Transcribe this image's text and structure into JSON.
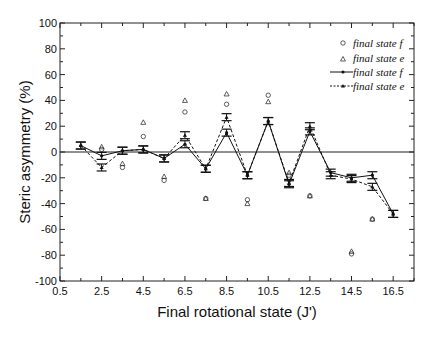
{
  "chart_data": {
    "type": "line",
    "title": "",
    "xlabel": "Final rotational state (J')",
    "ylabel": "Steric asymmetry (%)",
    "xlim": [
      0.5,
      17.5
    ],
    "ylim": [
      -100,
      100
    ],
    "x_ticks": [
      "0.5",
      "2.5",
      "4.5",
      "6.5",
      "8.5",
      "10.5",
      "12.5",
      "14.5",
      "16.5"
    ],
    "y_ticks": [
      "100",
      "80",
      "60",
      "40",
      "20",
      "0",
      "-20",
      "-40",
      "-60",
      "-80",
      "-100"
    ],
    "grid": false,
    "zero_line": true,
    "legend_position": "upper right",
    "series": [
      {
        "name": "final state f",
        "style": "open-circle",
        "x": [
          2.5,
          3.5,
          4.5,
          5.5,
          6.5,
          7.5,
          8.5,
          9.5,
          10.5,
          11.5,
          12.5,
          14.5,
          15.5
        ],
        "values": [
          2,
          -12,
          12,
          -22,
          31,
          -36,
          37,
          -37,
          44,
          -18,
          -34,
          -79,
          -52
        ]
      },
      {
        "name": "final state e",
        "style": "open-triangle",
        "x": [
          2.5,
          3.5,
          4.5,
          5.5,
          6.5,
          7.5,
          8.5,
          9.5,
          10.5,
          11.5,
          12.5,
          14.5,
          15.5
        ],
        "values": [
          4,
          -9,
          23,
          -19,
          40,
          -36,
          45,
          -40,
          39,
          -16,
          -34,
          -77,
          -52
        ]
      },
      {
        "name": "final state f",
        "style": "solid-line-with-errorbars",
        "x": [
          1.5,
          2.5,
          3.5,
          4.5,
          5.5,
          6.5,
          7.5,
          8.5,
          9.5,
          10.5,
          11.5,
          12.5,
          13.5,
          14.5,
          15.5,
          16.5
        ],
        "values": [
          5,
          -3,
          1,
          2,
          -5,
          6,
          -13,
          15,
          -18,
          24,
          -25,
          16,
          -16,
          -20,
          -18,
          -48
        ]
      },
      {
        "name": "final state e",
        "style": "dashed-line-with-errorbars",
        "x": [
          1.5,
          2.5,
          3.5,
          4.5,
          5.5,
          6.5,
          7.5,
          8.5,
          9.5,
          10.5,
          11.5,
          12.5,
          13.5,
          14.5,
          15.5,
          16.5
        ],
        "values": [
          5,
          -12,
          1,
          2,
          -5,
          13,
          -13,
          27,
          -18,
          24,
          -24,
          20,
          -18,
          -21,
          -27,
          -48
        ]
      }
    ]
  },
  "legend": {
    "items": [
      "final state f",
      "final state e",
      "final state f",
      "final state e"
    ]
  }
}
